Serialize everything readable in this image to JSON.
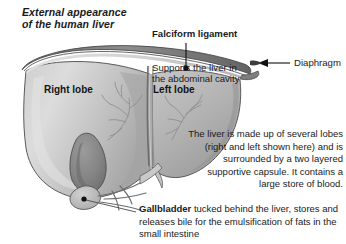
{
  "figure": {
    "title": "External appearance\nof the human liver",
    "diagram_name": "human-liver-external-anatomy",
    "background_color": "#ffffff",
    "text_color": "#1a1a1a"
  },
  "callouts": {
    "falciform": {
      "heading": "Falciform ligament",
      "body": "Supports the liver in\nthe abdominal cavity",
      "marker": "black-dot"
    },
    "diaphragm": {
      "label": "Diaphragm",
      "marker": "left-arrow"
    },
    "gallbladder": {
      "heading": "Gallbladder",
      "body": " tucked behind the liver, stores and releases bile for the emulsification of fats in the small intestine",
      "marker": "black-dot"
    }
  },
  "organ_labels": {
    "right_lobe": "Right lobe",
    "left_lobe": "Left lobe"
  },
  "description": {
    "text": "The liver is made up of several lobes (right and left shown here) and is surrounded by a two layered supportive capsule. It contains a large store of blood."
  },
  "palette": {
    "liver_light": "#d9d9d9",
    "liver_mid": "#b4b4b4",
    "liver_dark": "#9a9a9a",
    "gallbladder": "#8a8a8a",
    "capsule_rim": "#6e6e6e",
    "outline": "#4a4a4a",
    "vessel": "#8f8f8f"
  }
}
